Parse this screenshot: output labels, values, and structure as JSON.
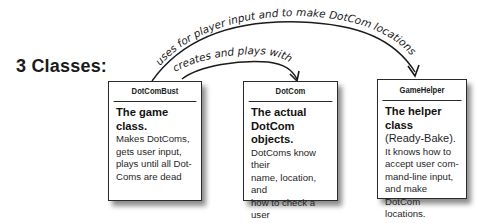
{
  "title": "3 Classes:",
  "arrows": [
    {
      "label": "uses for player input and to make DotCom locations",
      "from": "DotComBust",
      "to": "GameHelper"
    },
    {
      "label": "creates and plays with",
      "from": "DotComBust",
      "to": "DotCom"
    }
  ],
  "classes": [
    {
      "name": "DotComBust",
      "lead": "The game class.",
      "description_lines": [
        "Makes DotComs,",
        "gets  user input,",
        "plays until all Dot-",
        "Coms are dead"
      ]
    },
    {
      "name": "DotCom",
      "lead_lines": [
        "The actual",
        "DotCom objects."
      ],
      "description_lines": [
        "DotComs know their",
        "name, location, and",
        "how to check a user",
        "guess for a match."
      ]
    },
    {
      "name": "GameHelper",
      "lead": "The helper class",
      "lead_sub": "(Ready-Bake).",
      "description_lines": [
        "It knows how to",
        "accept user com-",
        "mand-line input,",
        "and make DotCom",
        "locations."
      ]
    }
  ],
  "colors": {
    "ink": "#1a1a1a",
    "box_border": "#2a2a2a",
    "background": "#ffffff"
  }
}
